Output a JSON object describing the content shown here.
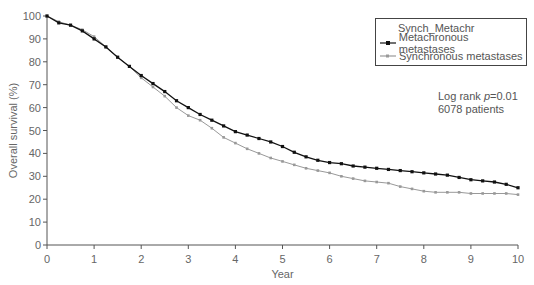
{
  "chart_data": {
    "type": "line",
    "title": "",
    "xlabel": "Year",
    "ylabel": "Overall survival (%)",
    "xlim": [
      0,
      10
    ],
    "ylim": [
      0,
      100
    ],
    "x_ticks": [
      "0",
      "1",
      "2",
      "3",
      "4",
      "5",
      "6",
      "7",
      "8",
      "9",
      "10"
    ],
    "y_ticks": [
      "0",
      "10",
      "20",
      "30",
      "40",
      "50",
      "60",
      "70",
      "80",
      "90",
      "100"
    ],
    "grid": false,
    "legend": {
      "title": "Synch_Metachr",
      "position": "upper right",
      "entries": [
        "Metachronous metastases",
        "Synchronous metastases"
      ]
    },
    "annotations": [
      "Log rank p=0.01",
      "6078 patients"
    ],
    "x": [
      0,
      0.25,
      0.5,
      0.75,
      1,
      1.25,
      1.5,
      1.75,
      2,
      2.25,
      2.5,
      2.75,
      3,
      3.25,
      3.5,
      3.75,
      4,
      4.25,
      4.5,
      4.75,
      5,
      5.25,
      5.5,
      5.75,
      6,
      6.25,
      6.5,
      6.75,
      7,
      7.25,
      7.5,
      7.75,
      8,
      8.25,
      8.5,
      8.75,
      9,
      9.25,
      9.5,
      9.75,
      10
    ],
    "series": [
      {
        "name": "Metachronous metastases",
        "color": "#111111",
        "values": [
          100,
          97,
          96,
          93.5,
          90,
          86.5,
          82,
          78,
          74,
          70.5,
          67,
          63,
          60,
          57,
          54.5,
          52,
          49.5,
          48,
          46.5,
          45,
          43,
          40.5,
          38.5,
          37,
          36,
          35.5,
          34.5,
          34,
          33.5,
          33,
          32.5,
          32,
          31.5,
          31,
          30.5,
          29.5,
          28.5,
          28,
          27.5,
          26.5,
          25
        ]
      },
      {
        "name": "Synchronous metastases",
        "color": "#999999",
        "values": [
          100,
          97.5,
          96,
          94,
          91,
          86.5,
          82,
          78,
          73,
          69,
          65,
          60,
          56.5,
          54.5,
          51,
          47,
          44.5,
          42,
          40,
          38,
          36.5,
          35,
          33.5,
          32.5,
          31.5,
          30,
          29,
          28,
          27.5,
          27,
          25.5,
          24.5,
          23.5,
          23,
          23,
          23,
          22.5,
          22.5,
          22.5,
          22.5,
          22
        ]
      }
    ]
  },
  "legend": {
    "title": "Synch_Metachr",
    "items": [
      {
        "label": "Metachronous metastases"
      },
      {
        "label": "Synchronous metastases"
      }
    ]
  },
  "annotation": {
    "line1_prefix": "Log rank ",
    "line1_p": "p",
    "line1_suffix": "=0.01",
    "line2": "6078 patients"
  }
}
